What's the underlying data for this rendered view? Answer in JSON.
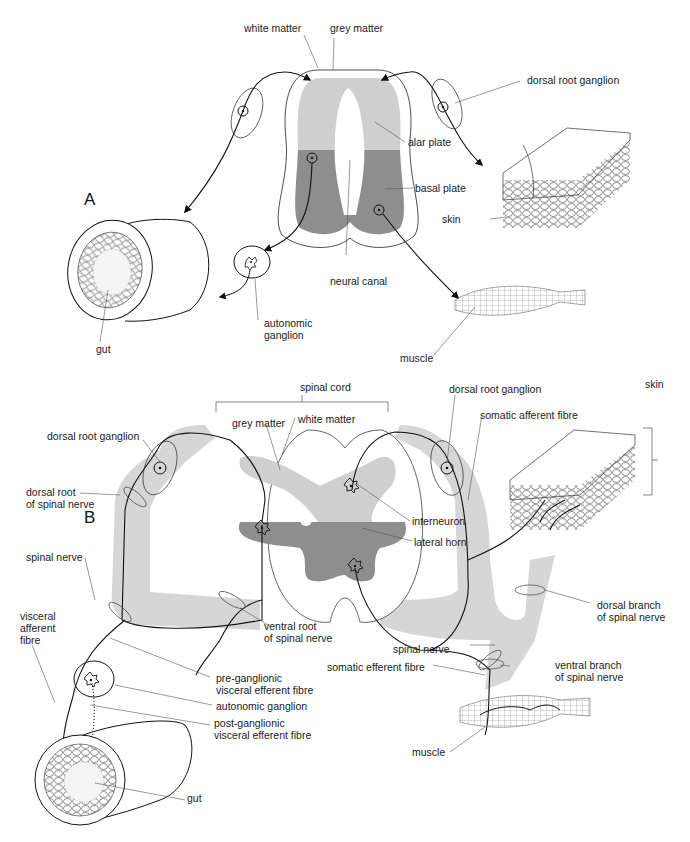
{
  "colors": {
    "white_matter_grey": "#d6d6d6",
    "alar_plate_light_grey": "#cfcfcf",
    "basal_plate_dark_grey": "#8e8e8e",
    "line": "#111111",
    "leader_line": "#555555"
  },
  "panel_a": {
    "letter": "A",
    "labels": {
      "white_matter": "white matter",
      "grey_matter": "grey matter",
      "dorsal_root_ganglion": "dorsal root ganglion",
      "alar_plate": "alar plate",
      "basal_plate": "basal plate",
      "skin": "skin",
      "neural_canal": "neural canal",
      "autonomic_ganglion": "autonomic\nganglion",
      "gut": "gut",
      "muscle": "muscle"
    }
  },
  "panel_b": {
    "letter": "B",
    "labels": {
      "spinal_cord": "spinal cord",
      "grey_matter": "grey matter",
      "white_matter": "white matter",
      "dorsal_root_ganglion_left": "dorsal root ganglion",
      "dorsal_root_ganglion_right": "dorsal root ganglion",
      "somatic_afferent_fibre": "somatic afferent fibre",
      "skin": "skin",
      "dorsal_root": "dorsal root\nof spinal nerve",
      "interneuron": "interneuron",
      "lateral_horn": "lateral horn",
      "spinal_nerve_left": "spinal nerve",
      "ventral_root": "ventral root\nof spinal nerve",
      "dorsal_branch": "dorsal branch\nof spinal nerve",
      "visceral_afferent_fibre": "visceral\nafferent\nfibre",
      "spinal_nerve_right": "spinal nerve",
      "somatic_efferent_fibre": "somatic efferent fibre",
      "ventral_branch": "ventral branch\nof spinal nerve",
      "pre_ganglionic": "pre-ganglionic\nvisceral efferent fibre",
      "autonomic_ganglion": "autonomic ganglion",
      "post_ganglionic": "post-ganglionic\nvisceral efferent fibre",
      "gut": "gut",
      "muscle": "muscle"
    }
  }
}
